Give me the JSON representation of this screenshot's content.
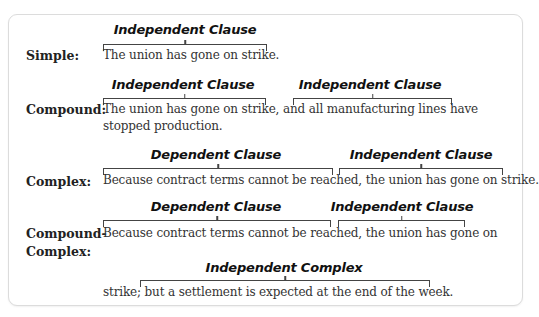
{
  "figure": {
    "rows": [
      {
        "type_label": "Simple:",
        "lines": [
          "The union has gone on strike."
        ],
        "clauses": [
          {
            "label": "Independent Clause",
            "kind": "independent"
          }
        ]
      },
      {
        "type_label": "Compound:",
        "lines": [
          "The union has gone on strike, and all manufacturing lines have",
          "stopped production."
        ],
        "clauses": [
          {
            "label": "Independent Clause",
            "kind": "independent"
          },
          {
            "label": "Independent Clause",
            "kind": "independent"
          }
        ]
      },
      {
        "type_label": "Complex:",
        "lines": [
          "Because contract terms cannot be reached, the union has gone on strike."
        ],
        "clauses": [
          {
            "label": "Dependent Clause",
            "kind": "dependent"
          },
          {
            "label": "Independent Clause",
            "kind": "independent"
          }
        ]
      },
      {
        "type_label_line1": "Compound-",
        "type_label_line2": "Complex:",
        "lines": [
          "Because contract terms cannot be reached, the union has gone on",
          "strike; but a settlement is expected at the end of the week."
        ],
        "clauses": [
          {
            "label": "Dependent Clause",
            "kind": "dependent"
          },
          {
            "label": "Independent Clause",
            "kind": "independent"
          },
          {
            "label": "Independent Complex",
            "kind": "independent"
          }
        ]
      }
    ]
  }
}
